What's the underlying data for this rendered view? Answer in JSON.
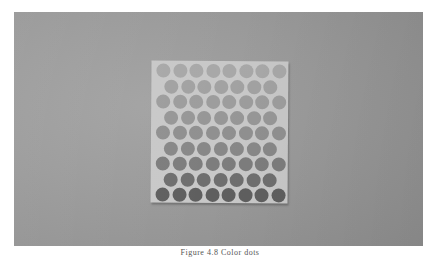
{
  "photo": {
    "description": "Photograph of a square sheet of circular color dots on a gray surface",
    "background_color": "#9a9a9a",
    "sheet_color": "#c8c8c8"
  },
  "dot_sheet": {
    "rows": [
      8,
      7,
      8,
      7,
      8,
      7,
      8,
      7,
      8
    ],
    "row_shades": [
      "#a8a8a8",
      "#a2a2a2",
      "#9d9d9d",
      "#979797",
      "#909090",
      "#888888",
      "#7d7d7d",
      "#6f6f6f",
      "#5f5f5f"
    ]
  },
  "caption": "Figure 4.8  Color dots"
}
